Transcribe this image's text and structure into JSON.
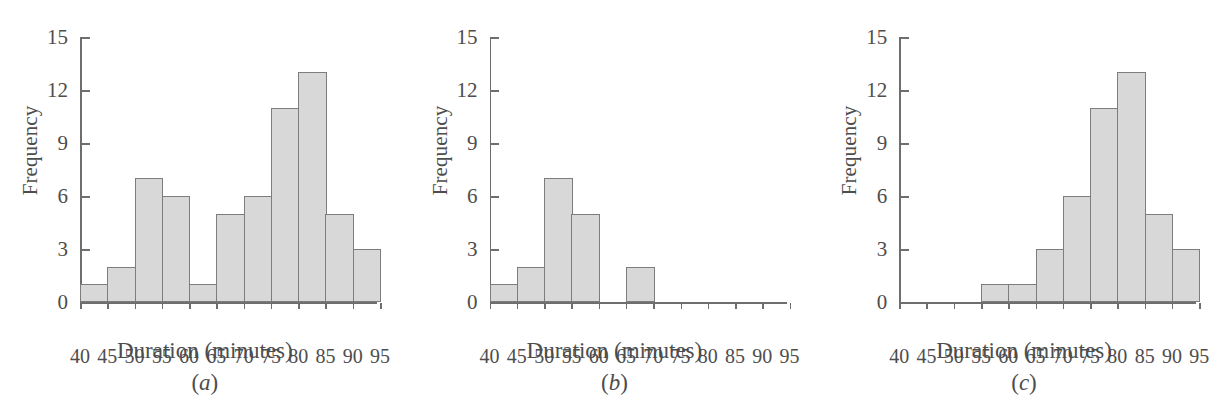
{
  "figure": {
    "axis_label_y": "Frequency",
    "axis_label_x": "Duration (minutes)",
    "bar_fill_color": "#d8d8d8",
    "bar_border_color": "#7d7d7d",
    "axis_color": "#6e6e6e",
    "text_color": "#4d4d4d",
    "background_color": "#ffffff"
  },
  "chart_data": [
    {
      "type": "bar",
      "title": "(a)",
      "caption": "(a)",
      "caption_letter": "a",
      "xlabel": "Duration (minutes)",
      "ylabel": "Frequency",
      "xlim": [
        40,
        95
      ],
      "ylim": [
        0,
        15
      ],
      "yticks": [
        0,
        3,
        6,
        9,
        12,
        15
      ],
      "ytick_labels": [
        "0",
        "3",
        "6",
        "9",
        "12",
        "15"
      ],
      "xticks": [
        40,
        45,
        50,
        55,
        60,
        65,
        70,
        75,
        80,
        85,
        90,
        95
      ],
      "xtick_labels": [
        "40",
        "45",
        "50",
        "55",
        "60",
        "65",
        "70",
        "75",
        "80",
        "85",
        "90",
        "95"
      ],
      "bin_width": 5,
      "bin_edges": [
        40,
        45,
        50,
        55,
        60,
        65,
        70,
        75,
        80,
        85,
        90,
        95
      ],
      "categories": [
        "40-45",
        "45-50",
        "50-55",
        "55-60",
        "60-65",
        "65-70",
        "70-75",
        "75-80",
        "80-85",
        "85-90",
        "90-95"
      ],
      "values": [
        1,
        2,
        7,
        6,
        1,
        5,
        6,
        11,
        13,
        5,
        3
      ],
      "grid": false,
      "legend": false
    },
    {
      "type": "bar",
      "title": "(b)",
      "caption": "(b)",
      "caption_letter": "b",
      "xlabel": "Duration (minutes)",
      "ylabel": "Frequency",
      "xlim": [
        40,
        95
      ],
      "ylim": [
        0,
        15
      ],
      "yticks": [
        0,
        3,
        6,
        9,
        12,
        15
      ],
      "ytick_labels": [
        "0",
        "3",
        "6",
        "9",
        "12",
        "15"
      ],
      "xticks": [
        40,
        45,
        50,
        55,
        60,
        65,
        70,
        75,
        80,
        85,
        90,
        95
      ],
      "xtick_labels": [
        "40",
        "45",
        "50",
        "55",
        "60",
        "65",
        "70",
        "75",
        "80",
        "85",
        "90",
        "95"
      ],
      "bin_width": 5,
      "bin_edges": [
        40,
        45,
        50,
        55,
        60,
        65,
        70,
        75,
        80,
        85,
        90,
        95
      ],
      "categories": [
        "40-45",
        "45-50",
        "50-55",
        "55-60",
        "60-65",
        "65-70",
        "70-75",
        "75-80",
        "80-85",
        "85-90",
        "90-95"
      ],
      "values": [
        1,
        2,
        7,
        5,
        0,
        2,
        0,
        0,
        0,
        0,
        0
      ],
      "grid": false,
      "legend": false
    },
    {
      "type": "bar",
      "title": "(c)",
      "caption": "(c)",
      "caption_letter": "c",
      "xlabel": "Duration (minutes)",
      "ylabel": "Frequency",
      "xlim": [
        40,
        95
      ],
      "ylim": [
        0,
        15
      ],
      "yticks": [
        0,
        3,
        6,
        9,
        12,
        15
      ],
      "ytick_labels": [
        "0",
        "3",
        "6",
        "9",
        "12",
        "15"
      ],
      "xticks": [
        40,
        45,
        50,
        55,
        60,
        65,
        70,
        75,
        80,
        85,
        90,
        95
      ],
      "xtick_labels": [
        "40",
        "45",
        "50",
        "55",
        "60",
        "65",
        "70",
        "75",
        "80",
        "85",
        "90",
        "95"
      ],
      "bin_width": 5,
      "bin_edges": [
        40,
        45,
        50,
        55,
        60,
        65,
        70,
        75,
        80,
        85,
        90,
        95
      ],
      "categories": [
        "40-45",
        "45-50",
        "50-55",
        "55-60",
        "60-65",
        "65-70",
        "70-75",
        "75-80",
        "80-85",
        "85-90",
        "90-95"
      ],
      "values": [
        0,
        0,
        0,
        1,
        1,
        3,
        6,
        11,
        13,
        5,
        3
      ],
      "grid": false,
      "legend": false
    }
  ]
}
